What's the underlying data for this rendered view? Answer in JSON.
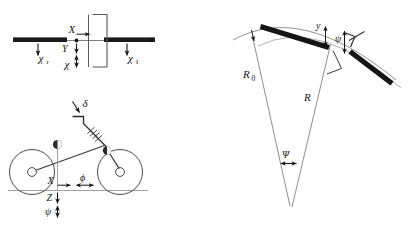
{
  "figure": {
    "background_color": "#ffffff",
    "line_color": "#3a3a3a",
    "bar_color": "#1a1a1a",
    "label_color": "#141414"
  },
  "panel_top_left": {
    "name": "axle-plan-view",
    "labels": {
      "chi_rear": "χ",
      "chi_rear_sub": "r",
      "chi_front": "χ",
      "chi_front_sub": "f",
      "axis_x": "X",
      "axis_y": "Y",
      "chi_center": "χ"
    }
  },
  "panel_bottom_left": {
    "name": "bicycle-side-view",
    "labels": {
      "steer_angle": "δ",
      "axis_x": "X",
      "axis_z": "Z",
      "roll_phi": "ϕ",
      "yaw_psi": "ψ"
    }
  },
  "panel_right": {
    "name": "curved-path-geometry",
    "labels": {
      "radius_outer": "R",
      "radius_outer_sub": "0",
      "radius_inner": "R",
      "lateral_offset": "y",
      "heading_psi": "ψ",
      "path_angle_psi": "Ψ"
    }
  }
}
